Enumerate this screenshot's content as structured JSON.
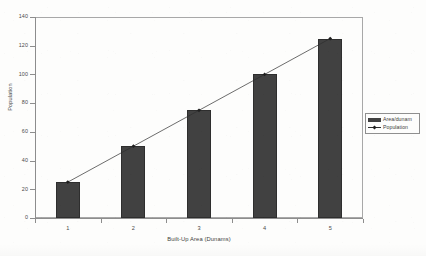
{
  "chart_data": {
    "type": "bar",
    "title": "",
    "subtitle": "",
    "xlabel": "Built-Up Area (Dunams)",
    "ylabel": "Population",
    "categories": [
      "1",
      "2",
      "3",
      "4",
      "5"
    ],
    "ylim": [
      0,
      140
    ],
    "ytick_step": 20,
    "yticks": [
      "0",
      "20",
      "40",
      "60",
      "80",
      "100",
      "120",
      "140"
    ],
    "grid": false,
    "legend_position": "right",
    "series": [
      {
        "name": "Area/dunam",
        "type": "bar",
        "color": "#414141",
        "values": [
          25,
          50,
          75,
          100,
          125
        ]
      },
      {
        "name": "Population",
        "type": "line",
        "color": "#2e2e2e",
        "marker": "diamond",
        "values": [
          25,
          50,
          75,
          100,
          125
        ]
      }
    ],
    "annotations": []
  },
  "legend": {
    "items": [
      {
        "label": "Area/dunam",
        "swatch": "bar-swatch-icon"
      },
      {
        "label": "Population",
        "swatch": "line-marker-icon"
      }
    ]
  }
}
